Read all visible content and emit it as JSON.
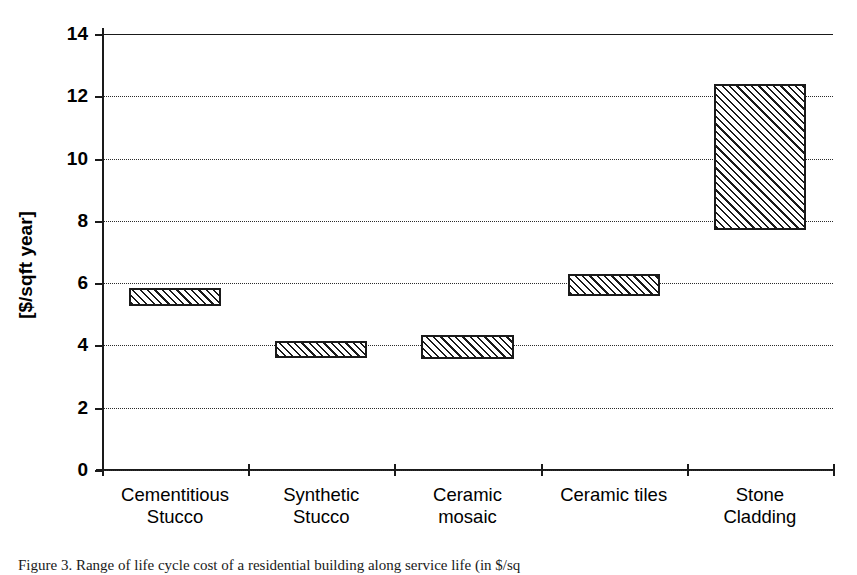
{
  "chart_data": {
    "type": "bar",
    "subtype": "floating-range-bar",
    "title": "",
    "xlabel": "",
    "ylabel": "[$/sqft year]",
    "ylim": [
      0,
      14
    ],
    "ytick_values": [
      0,
      2,
      4,
      6,
      8,
      10,
      12,
      14
    ],
    "ytick_labels": [
      "0",
      "2",
      "4",
      "6",
      "8",
      "10",
      "12",
      "14"
    ],
    "grid": true,
    "grid_style": "dotted-horizontal",
    "legend": "none",
    "categories": [
      "Cementitious Stucco",
      "Synthetic Stucco",
      "Ceramic mosaic",
      "Ceramic tiles",
      "Stone Cladding"
    ],
    "category_lines": [
      [
        "Cementitious",
        "Stucco"
      ],
      [
        "Synthetic",
        "Stucco"
      ],
      [
        "Ceramic",
        "mosaic"
      ],
      [
        "Ceramic tiles",
        ""
      ],
      [
        "Stone",
        "Cladding"
      ]
    ],
    "series": [
      {
        "name": "low",
        "values": [
          5.25,
          3.6,
          3.55,
          5.6,
          7.7
        ]
      },
      {
        "name": "high",
        "values": [
          5.85,
          4.15,
          4.35,
          6.3,
          12.4
        ]
      }
    ],
    "ranges": [
      {
        "category": "Cementitious Stucco",
        "low": 5.25,
        "high": 5.85
      },
      {
        "category": "Synthetic Stucco",
        "low": 3.6,
        "high": 4.15
      },
      {
        "category": "Ceramic mosaic",
        "low": 3.55,
        "high": 4.35
      },
      {
        "category": "Ceramic tiles",
        "low": 5.6,
        "high": 6.3
      },
      {
        "category": "Stone Cladding",
        "low": 7.7,
        "high": 12.4
      }
    ],
    "bar_fill": "diagonal-hatch",
    "colors": {
      "axis": "#1a1a1a",
      "grid": "#2b2b2b",
      "bar_edge": "#1a1a1a",
      "bar_fill": "#1a1a1a",
      "background": "#ffffff"
    }
  },
  "caption": {
    "text": "Figure 3. Range of life cycle cost of a residential building along service life (in $/sq"
  }
}
